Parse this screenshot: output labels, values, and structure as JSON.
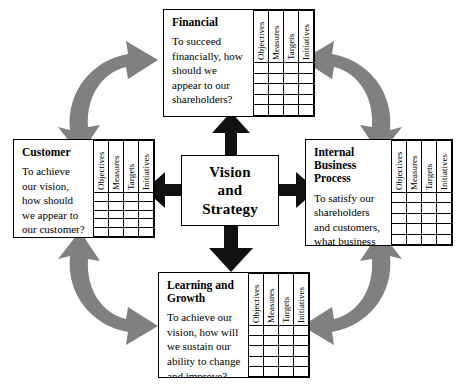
{
  "diagram": {
    "center": {
      "label": "Vision\nand\nStrategy",
      "label_lines": [
        "Vision",
        "and",
        "Strategy"
      ]
    },
    "grid_columns": [
      "Objectives",
      "Measures",
      "Targets",
      "Initiatives"
    ],
    "grid_rows": 5,
    "perspectives": [
      {
        "id": "financial",
        "title": "Financial",
        "question": "To succeed financially, how should we appear to our shareholders?",
        "position": "top"
      },
      {
        "id": "customer",
        "title": "Customer",
        "question": "To achieve our vision, how should we appear to our customer?",
        "position": "left"
      },
      {
        "id": "internal-business-process",
        "title": "Internal Business Process",
        "question": "To satisfy our shareholders and customers, what business processes must we excel at?",
        "position": "right"
      },
      {
        "id": "learning-and-growth",
        "title": "Learning and Growth",
        "question": "To achieve our vision, how will we sustain our ability to change and improve?",
        "position": "bottom"
      }
    ],
    "connectors": {
      "straight_arrows": [
        {
          "name": "center-to-financial",
          "direction": "up"
        },
        {
          "name": "center-to-learning-and-growth",
          "direction": "down"
        },
        {
          "name": "center-to-customer",
          "direction": "left"
        },
        {
          "name": "center-to-internal-business-process",
          "direction": "right"
        }
      ],
      "curved_arrows": [
        {
          "name": "customer-financial-link",
          "corner": "top-left",
          "double_headed": true
        },
        {
          "name": "financial-internal-link",
          "corner": "top-right",
          "double_headed": true
        },
        {
          "name": "customer-learning-link",
          "corner": "bottom-left",
          "double_headed": true
        },
        {
          "name": "learning-internal-link",
          "corner": "bottom-right",
          "double_headed": true
        }
      ]
    },
    "colors": {
      "line": "#000000",
      "straight_arrow": "#111111",
      "curved_arrow": "#808080",
      "background": "#ffffff"
    }
  }
}
